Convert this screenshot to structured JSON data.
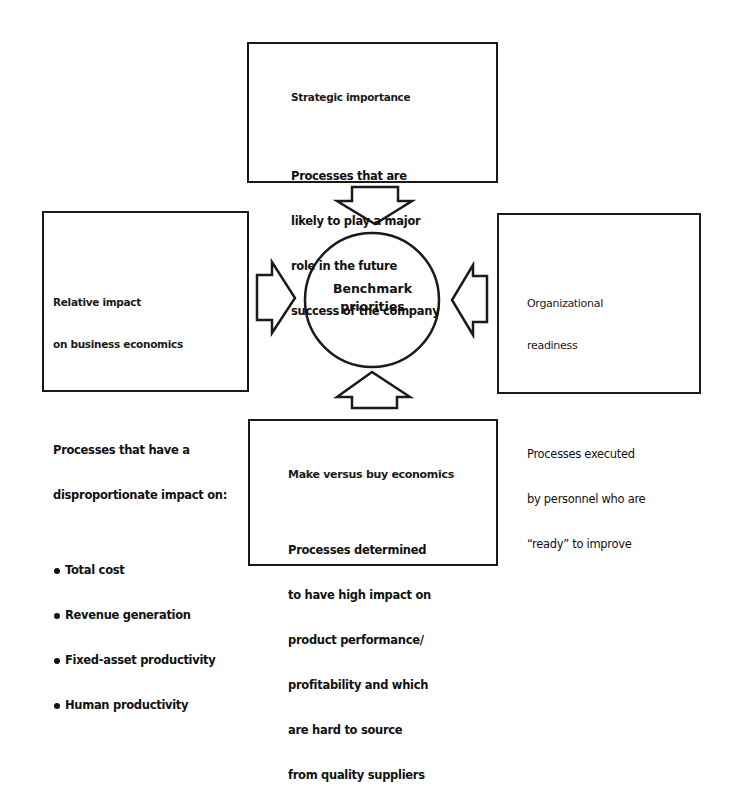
{
  "diagram": {
    "center": {
      "line1": "Benchmark",
      "line2": "priorities"
    },
    "boxes": {
      "top": {
        "heading": "Strategic importance",
        "body": [
          "Processes that are",
          "likely to play a major",
          "role in the future",
          "success of the company"
        ]
      },
      "left": {
        "heading": [
          "Relative impact",
          "on business economics"
        ],
        "body": [
          "Processes that have a",
          "disproportionate impact on:"
        ],
        "bullets": [
          "Total cost",
          "Revenue generation",
          "Fixed-asset productivity",
          "Human productivity"
        ]
      },
      "right": {
        "heading": [
          "Organizational",
          "readiness"
        ],
        "body": [
          "Processes executed",
          "by personnel who are",
          "“ready” to improve"
        ]
      },
      "bottom": {
        "heading": "Make versus buy economics",
        "body": [
          "Processes determined",
          "to have high impact on",
          "product performance/",
          "profitability and which",
          "are hard to source",
          "from quality suppliers"
        ]
      }
    },
    "arrows": [
      {
        "from": "top",
        "to": "center",
        "direction": "down"
      },
      {
        "from": "left",
        "to": "center",
        "direction": "right"
      },
      {
        "from": "right",
        "to": "center",
        "direction": "left"
      },
      {
        "from": "bottom",
        "to": "center",
        "direction": "up"
      }
    ],
    "colors": {
      "line": "#1a1a1a",
      "background": "#ffffff"
    }
  }
}
